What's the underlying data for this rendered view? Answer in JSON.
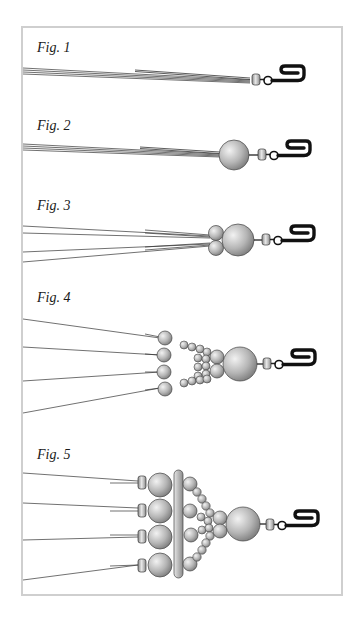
{
  "figures": [
    {
      "label": "Fig. 1",
      "top": 40
    },
    {
      "label": "Fig. 2",
      "top": 118
    },
    {
      "label": "Fig. 3",
      "top": 198
    },
    {
      "label": "Fig. 4",
      "top": 290
    },
    {
      "label": "Fig. 5",
      "top": 447
    }
  ],
  "colors": {
    "frame_border": "#cfcfcf",
    "bead_light": "#eeeeee",
    "bead_dark": "#8a8a8a",
    "outline": "#333333",
    "hook": "#111111",
    "string": "#333333"
  }
}
